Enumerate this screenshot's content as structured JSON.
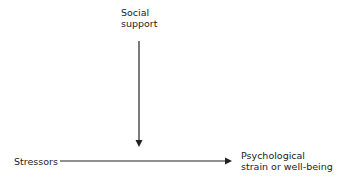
{
  "diagram": {
    "nodes": {
      "moderator": [
        "Social",
        "support"
      ],
      "predictor": "Stressors",
      "outcome": [
        "Psychological",
        "strain or well-being"
      ]
    },
    "edges": [
      {
        "from": "Social support",
        "to": "Stressors → Psychological strain or well-being path",
        "type": "moderation arrow"
      },
      {
        "from": "Stressors",
        "to": "Psychological strain or well-being",
        "type": "direct arrow"
      }
    ],
    "colors": {
      "line": "#222222",
      "text": "#222222",
      "background": "#ffffff"
    }
  }
}
